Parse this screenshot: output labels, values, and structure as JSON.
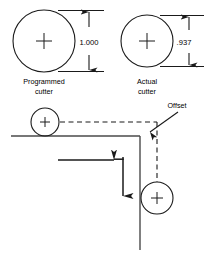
{
  "figure": {
    "title_text": "",
    "stroke_color": "#1a1a1a",
    "background_color": "#ffffff"
  },
  "top_section": {
    "programmed": {
      "label_line1": "Programmed",
      "label_line2": "cutter",
      "dimension_value": "1.000",
      "circle": {
        "cx": 44,
        "cy": 41,
        "r": 31
      }
    },
    "actual": {
      "label_line1": "Actual",
      "label_line2": "cutter",
      "dimension_value": ".937",
      "circle": {
        "cx": 147,
        "cy": 41,
        "r": 26
      }
    }
  },
  "bottom_section": {
    "offset_label": "Offset",
    "upper_cutter": {
      "cx": 45,
      "cy": 122,
      "r": 14
    },
    "lower_cutter": {
      "cx": 157,
      "cy": 198,
      "r": 16
    },
    "corner": {
      "x": 140,
      "y": 136
    }
  },
  "icons": {
    "center_mark": "crosshair-icon",
    "dimension_arrow": "dimension-arrow-icon",
    "feed_arrow": "feed-direction-arrow-icon",
    "leader_arrow": "leader-arrow-icon"
  }
}
